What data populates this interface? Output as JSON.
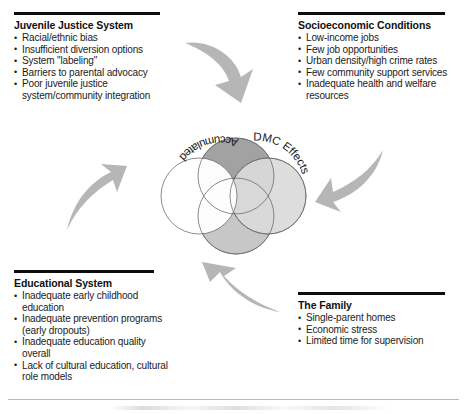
{
  "diagram": {
    "title": "Accumulated DMC Effects",
    "type": "venn-with-contributing-factors"
  },
  "blocks": {
    "juvenile_justice": {
      "heading": "Juvenile Justice System",
      "items": [
        "Racial/ethnic bias",
        "Insufficient diversion options",
        "System \"labeling\"",
        "Barriers to parental advocacy",
        "Poor juvenile justice system/community integration"
      ]
    },
    "socioeconomic": {
      "heading": "Socioeconomic Conditions",
      "items": [
        "Low-income jobs",
        "Few job opportunities",
        "Urban density/high crime rates",
        "Few community support services",
        "Inadequate health and welfare resources"
      ]
    },
    "educational": {
      "heading": "Educational System",
      "items": [
        "Inadequate early childhood education",
        "Inadequate prevention programs (early dropouts)",
        "Inadequate education quality overall",
        "Lack of cultural education, cultural role models"
      ]
    },
    "family": {
      "heading": "The Family",
      "items": [
        "Single-parent homes",
        "Economic stress",
        "Limited time for supervision"
      ]
    }
  },
  "venn": {
    "label_left": "Accumulated",
    "label_right": "DMC Effects",
    "circles": [
      {
        "name": "top",
        "fill": "#a0a0a0"
      },
      {
        "name": "left",
        "fill": "#ffffff"
      },
      {
        "name": "bottom",
        "fill": "#c3c3c3"
      },
      {
        "name": "right",
        "fill": "#d9d9d9"
      }
    ]
  },
  "arrows": {
    "top_left_to_center": "curved-arrow-down-right",
    "top_right_to_center": "curved-arrow-down-left",
    "bottom_left_to_center": "curved-arrow-up-right",
    "bottom_right_to_center": "curved-arrow-up-left",
    "color": "#b5b5b5"
  },
  "bullet_glyph": "•"
}
